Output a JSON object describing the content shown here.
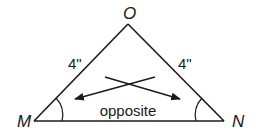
{
  "diagram": {
    "type": "isosceles-triangle",
    "vertices": {
      "apex": {
        "label": "O",
        "x": 128,
        "y": 24
      },
      "left": {
        "label": "M",
        "x": 34,
        "y": 121
      },
      "right": {
        "label": "N",
        "x": 224,
        "y": 121
      }
    },
    "sides": {
      "left_side_length": "4\"",
      "right_side_length": "4\""
    },
    "annotation": "opposite",
    "colors": {
      "stroke": "#1a1a1a",
      "background": "#ffffff"
    }
  }
}
